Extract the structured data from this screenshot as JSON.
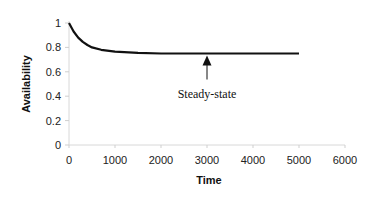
{
  "chart_data": {
    "type": "line",
    "title": "",
    "xlabel": "Time",
    "ylabel": "Availability",
    "xlim": [
      0,
      6000
    ],
    "ylim": [
      0,
      1
    ],
    "xticks": [
      0,
      1000,
      2000,
      3000,
      4000,
      5000,
      6000
    ],
    "yticks": [
      0,
      0.2,
      0.4,
      0.6,
      0.8,
      1
    ],
    "ytick_labels": [
      "0",
      "0.2",
      "0.4",
      "0.6",
      "0.8",
      "1"
    ],
    "grid": false,
    "legend": null,
    "series": [
      {
        "name": "Availability",
        "x": [
          0,
          100,
          200,
          300,
          400,
          500,
          700,
          1000,
          1500,
          2000,
          3000,
          4000,
          5000
        ],
        "y": [
          1.0,
          0.93,
          0.88,
          0.845,
          0.82,
          0.8,
          0.78,
          0.765,
          0.755,
          0.75,
          0.75,
          0.75,
          0.75
        ]
      }
    ],
    "annotations": [
      {
        "text": "Steady-state",
        "arrow_x": 3000,
        "arrow_y": 0.75
      }
    ]
  }
}
